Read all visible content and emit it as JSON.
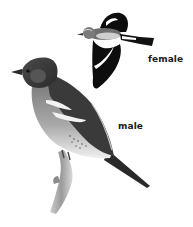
{
  "figure": {
    "labels": {
      "female": "female",
      "male": "male"
    },
    "colors": {
      "background": "#ffffff",
      "ink": "#111111",
      "text": "#1a1a1a"
    }
  }
}
